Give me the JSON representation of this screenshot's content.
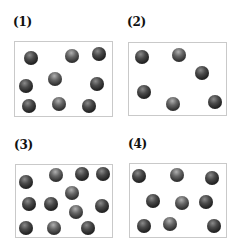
{
  "panels": [
    {
      "label": "(1)",
      "label_pos": [
        13,
        16
      ],
      "box": {
        "x": 14,
        "y": 41,
        "w": 99,
        "h": 76
      },
      "particle_count": 9,
      "particles": [
        [
          31,
          58
        ],
        [
          72,
          56
        ],
        [
          99,
          54
        ],
        [
          26,
          86
        ],
        [
          55,
          79
        ],
        [
          97,
          84
        ],
        [
          29,
          106
        ],
        [
          59,
          104
        ],
        [
          89,
          106
        ]
      ]
    },
    {
      "label": "(2)",
      "label_pos": [
        127,
        16
      ],
      "box": {
        "x": 128,
        "y": 42,
        "w": 99,
        "h": 74
      },
      "particle_count": 6,
      "particles": [
        [
          142,
          57
        ],
        [
          179,
          55
        ],
        [
          202,
          73
        ],
        [
          144,
          92
        ],
        [
          173,
          104
        ],
        [
          215,
          102
        ]
      ]
    },
    {
      "label": "(3)",
      "label_pos": [
        14,
        139
      ],
      "box": {
        "x": 15,
        "y": 164,
        "w": 98,
        "h": 74
      },
      "particle_count": 12,
      "particles": [
        [
          26,
          182
        ],
        [
          56,
          175
        ],
        [
          82,
          174
        ],
        [
          103,
          174
        ],
        [
          72,
          193
        ],
        [
          29,
          204
        ],
        [
          51,
          204
        ],
        [
          76,
          212
        ],
        [
          102,
          206
        ],
        [
          26,
          228
        ],
        [
          54,
          228
        ],
        [
          88,
          228
        ]
      ]
    },
    {
      "label": "(4)",
      "label_pos": [
        128,
        138
      ],
      "box": {
        "x": 129,
        "y": 163,
        "w": 98,
        "h": 75
      },
      "particle_count": 9,
      "particles": [
        [
          139,
          176
        ],
        [
          177,
          175
        ],
        [
          212,
          178
        ],
        [
          153,
          201
        ],
        [
          182,
          203
        ],
        [
          206,
          202
        ],
        [
          144,
          226
        ],
        [
          170,
          224
        ],
        [
          214,
          226
        ]
      ]
    }
  ],
  "colors": {
    "border": "#c9c9c9",
    "particle": "#2a2a2a",
    "label": "#111111"
  }
}
